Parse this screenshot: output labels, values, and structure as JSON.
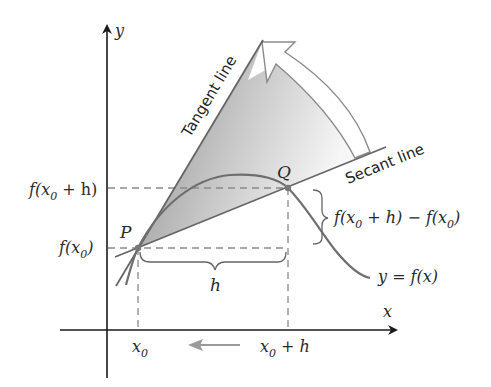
{
  "diagram": {
    "axes": {
      "x_label": "x",
      "y_label": "y"
    },
    "points": {
      "P": {
        "label": "P"
      },
      "Q": {
        "label": "Q"
      }
    },
    "lines": {
      "tangent_label": "Tangent line",
      "secant_label": "Secant line"
    },
    "labels": {
      "f_x0_plus_h": "f(x",
      "f_x0": "f(x",
      "x0": "x",
      "x0_plus_h": "x",
      "h": "h",
      "difference": "f(x",
      "curve": "y = f(x)",
      "sub0": "0",
      "plus_h_close": " + h)",
      "close_paren": ")",
      "plus_h": " + h",
      "minus_f": " + h) − f(x"
    },
    "colors": {
      "axis": "#1a1a1a",
      "curve": "#6e6e6e",
      "dashed": "#8a8a8a",
      "shade_dark": "#8f8f8f",
      "shade_light": "#f2f2f2",
      "arrow_gray": "#9a9a9a"
    }
  }
}
